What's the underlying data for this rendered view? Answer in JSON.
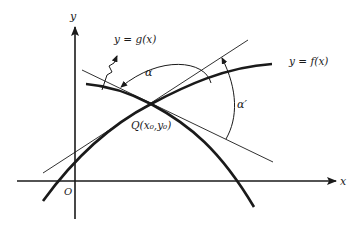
{
  "diagram": {
    "axes": {
      "x_label": "x",
      "y_label": "y",
      "origin_label": "O"
    },
    "curves": [
      {
        "id": "f",
        "label": "y = f(x)"
      },
      {
        "id": "g",
        "label": "y = g(x)"
      }
    ],
    "intersection_point": {
      "label": "Q(x₀,y₀)"
    },
    "angles": [
      {
        "id": "alpha",
        "label": "α"
      },
      {
        "id": "alpha_prime",
        "label": "α′"
      }
    ],
    "colors": {
      "ink": "#1a1a1a",
      "background": "#ffffff"
    }
  }
}
